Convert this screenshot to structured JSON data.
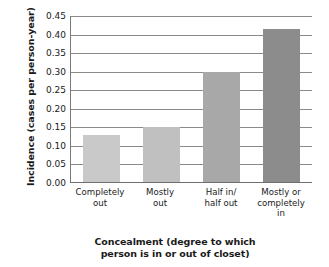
{
  "chart_data": {
    "type": "bar",
    "title": "",
    "xlabel": "Concealment (degree to which\nperson is in or out of closet)",
    "ylabel": "Incidence (cases per person-year)",
    "categories": [
      "Completely\nout",
      "Mostly\nout",
      "Half in/\nhalf out",
      "Mostly or\ncompletely\nin"
    ],
    "values": [
      0.13,
      0.15,
      0.3,
      0.415
    ],
    "bar_colors": [
      "#c9c9c9",
      "#c0c0c0",
      "#a8a8a8",
      "#8c8c8c"
    ],
    "ylim": [
      0.0,
      0.45
    ],
    "ytick_labels": [
      "0.45",
      "0.40",
      "0.35",
      "0.30",
      "0.25",
      "0.20",
      "0.15",
      "0.10",
      "0.05",
      "0.00"
    ],
    "ytick_values": [
      0.45,
      0.4,
      0.35,
      0.3,
      0.25,
      0.2,
      0.15,
      0.1,
      0.05,
      0.0
    ],
    "grid": true,
    "grid_color": "#8a8a8a",
    "axis_color": "#6e6e6e",
    "legend": null,
    "legend_position": "none",
    "background": "#ffffff"
  }
}
